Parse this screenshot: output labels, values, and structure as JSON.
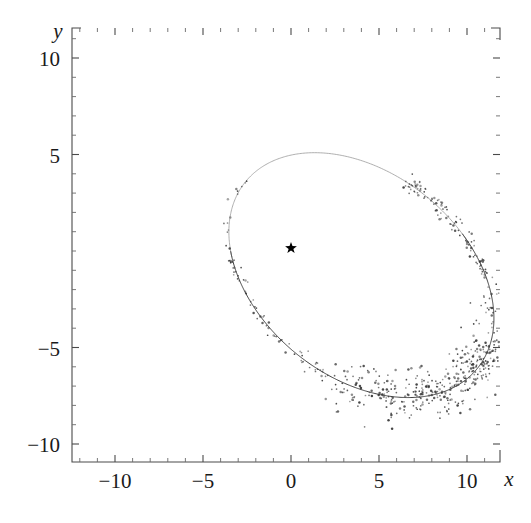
{
  "figure": {
    "background_color": "#ffffff",
    "width": 531,
    "height": 523
  },
  "chart_data": {
    "type": "scatter",
    "title": "",
    "subtitle": "",
    "xlabel": "x",
    "ylabel": "y",
    "xlim": [
      -12.5,
      11.9
    ],
    "ylim": [
      -12.0,
      11.5
    ],
    "grid": false,
    "legend": null,
    "annotations": [
      {
        "name": "focus-star",
        "marker": "star",
        "x": 0.0,
        "y": 0.15,
        "color": "#000000",
        "label": ""
      }
    ],
    "xticks": [
      -10,
      -5,
      0,
      5,
      10
    ],
    "xtick_labels": [
      "−10",
      "−5",
      "0",
      "5",
      "10"
    ],
    "yticks": [
      10,
      5,
      -5,
      -10
    ],
    "ytick_labels": [
      "10",
      "5",
      "−5",
      "−10"
    ],
    "minor_tick_step": 1,
    "series": [
      {
        "name": "fitted-orbit-ellipse",
        "type": "line",
        "color": "#2e2e2e",
        "description": "Tilted ellipse orbit trace",
        "ellipse": {
          "center_x": 4.0,
          "center_y": -1.25,
          "semi_major": 8.2,
          "semi_minor": 5.45,
          "rotation_deg": -32.0
        }
      },
      {
        "name": "observation-scatter",
        "type": "scatter",
        "color": "#3a3a3a",
        "point_count": 640,
        "description": "Measured points scattered along the ellipse, densest on the right and lower-right arc"
      }
    ],
    "axis_colors": {
      "frame": "#4a4a4a",
      "tick": "#4a4a4a",
      "text": "#1a1a1a"
    }
  },
  "plot_geometry": {
    "frame_left": 72,
    "frame_right": 500,
    "frame_top": 28,
    "frame_bottom": 462,
    "x_origin_px": 291,
    "y_origin_px": 251,
    "px_per_unit_x": 17.6,
    "px_per_unit_y": 19.3
  }
}
